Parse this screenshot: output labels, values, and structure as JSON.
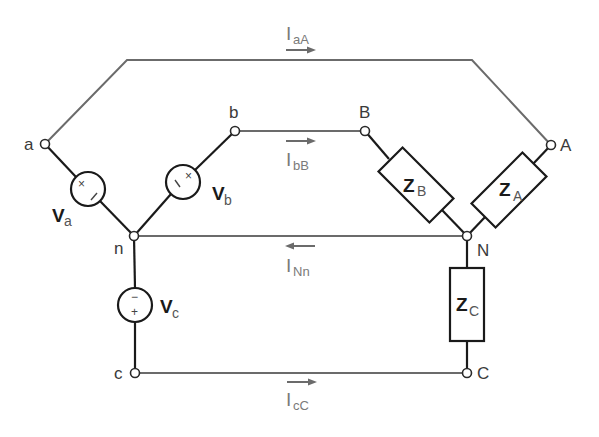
{
  "diagram": {
    "type": "three-phase Y-Y circuit",
    "nodes": {
      "a": "a",
      "b": "b",
      "c": "c",
      "n": "n",
      "A": "A",
      "B": "B",
      "C": "C",
      "N": "N"
    },
    "sources": {
      "Va": {
        "main": "V",
        "sub": "a",
        "polarity_plus": "+",
        "polarity_minus": "−"
      },
      "Vb": {
        "main": "V",
        "sub": "b",
        "polarity_plus": "+",
        "polarity_minus": "−"
      },
      "Vc": {
        "main": "V",
        "sub": "c",
        "polarity_plus": "+",
        "polarity_minus": "−"
      }
    },
    "impedances": {
      "ZA": {
        "main": "Z",
        "sub": "A"
      },
      "ZB": {
        "main": "Z",
        "sub": "B"
      },
      "ZC": {
        "main": "Z",
        "sub": "C"
      }
    },
    "currents": {
      "IaA": {
        "main": "I",
        "sub": "aA",
        "direction": "right"
      },
      "IbB": {
        "main": "I",
        "sub": "bB",
        "direction": "right"
      },
      "INn": {
        "main": "I",
        "sub": "Nn",
        "direction": "left"
      },
      "IcC": {
        "main": "I",
        "sub": "cC",
        "direction": "right"
      }
    },
    "colors": {
      "line_wires": "#6b6b6b",
      "component_wires": "#1a1a1a",
      "current_labels": "#7a7a7a"
    }
  }
}
